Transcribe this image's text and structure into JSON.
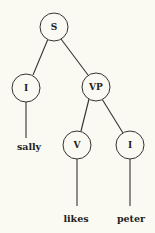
{
  "tree": {
    "nodes": {
      "s": {
        "label": "S"
      },
      "i_subject": {
        "label": "I"
      },
      "vp": {
        "label": "VP"
      },
      "v": {
        "label": "V"
      },
      "i_object": {
        "label": "I"
      }
    },
    "leaves": {
      "sally": {
        "label": "sally"
      },
      "likes": {
        "label": "likes"
      },
      "peter": {
        "label": "peter"
      }
    }
  }
}
